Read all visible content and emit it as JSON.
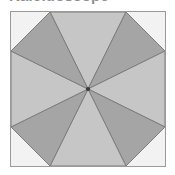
{
  "figure": {
    "title": "Kaleidoscope",
    "frame": {
      "border_color": "#9a9a9a",
      "background_color": "#fbfbfb",
      "x": 10,
      "y": 11,
      "width": 156,
      "height": 156
    },
    "center": {
      "x": 78,
      "y": 78
    },
    "center_dot_color": "#3a3a3a",
    "outline_color": "#7d7d7d",
    "colors": {
      "dark_sector": "#a5a5a5",
      "light_sector": "#c6c6c6",
      "corner_light": "#f2f2f2",
      "page_background": "#ffffff",
      "title_text": "#8f8f8f"
    },
    "sector_count": 8,
    "sectors": [
      {
        "name": "sector-north",
        "fill": "#c6c6c6",
        "tone": "light"
      },
      {
        "name": "sector-northeast",
        "fill": "#a5a5a5",
        "tone": "dark"
      },
      {
        "name": "sector-east",
        "fill": "#c6c6c6",
        "tone": "light"
      },
      {
        "name": "sector-southeast",
        "fill": "#a5a5a5",
        "tone": "dark"
      },
      {
        "name": "sector-south",
        "fill": "#c6c6c6",
        "tone": "light"
      },
      {
        "name": "sector-southwest",
        "fill": "#a5a5a5",
        "tone": "dark"
      },
      {
        "name": "sector-west",
        "fill": "#c6c6c6",
        "tone": "light"
      },
      {
        "name": "sector-northwest",
        "fill": "#a5a5a5",
        "tone": "dark"
      }
    ],
    "corners": [
      {
        "name": "corner-top-left",
        "fill": "#f2f2f2"
      },
      {
        "name": "corner-top-right",
        "fill": "#f2f2f2"
      },
      {
        "name": "corner-bottom-right",
        "fill": "#f2f2f2"
      },
      {
        "name": "corner-bottom-left",
        "fill": "#f2f2f2"
      }
    ]
  }
}
